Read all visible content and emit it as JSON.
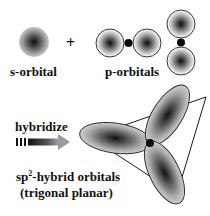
{
  "diagram": {
    "s_orbital": {
      "label": "s-orbital"
    },
    "plus_sign": "+",
    "p_orbitals": {
      "label": "p-orbitals"
    },
    "hybridize": {
      "label": "hybridize"
    },
    "sp2": {
      "label_prefix": "sp",
      "label_superscript": "2",
      "label_suffix": "-hybrid orbitals",
      "geometry": "(trigonal planar)"
    },
    "colors": {
      "ink": "#111111",
      "lobe_core": "#1a1a1a",
      "lobe_edge": "#d8d8d8",
      "background": "#ffffff"
    }
  }
}
